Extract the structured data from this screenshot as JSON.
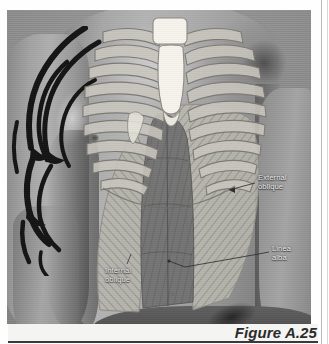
{
  "figure": {
    "caption": "Figure A.25",
    "alt_subject": "Male torso photograph with anatomical overlay of rib cage and abdominal musculature",
    "labels": [
      {
        "id": "external-oblique",
        "text": "External\noblique",
        "position": "right-upper"
      },
      {
        "id": "linea-alba",
        "text": "Linea\nalba",
        "position": "right-lower"
      },
      {
        "id": "internal-oblique",
        "text": "Internal\noblique",
        "position": "left-lower"
      }
    ],
    "anatomy_structures": [
      {
        "id": "sternum",
        "name": "Sternum",
        "fill": "#f3f1ea"
      },
      {
        "id": "ribs",
        "name": "Rib cage",
        "fill": "#c9c7bf"
      },
      {
        "id": "rectus-abdominis",
        "name": "Rectus abdominis",
        "fill": "#6e6e6e"
      },
      {
        "id": "external-oblique",
        "name": "External oblique",
        "fill": "#b5b3ab"
      },
      {
        "id": "internal-oblique",
        "name": "Internal oblique",
        "fill": "#b0aea6"
      },
      {
        "id": "tattoo",
        "name": "Tribal arm tattoo",
        "fill": "#1c1c1c"
      }
    ],
    "colors": {
      "page": "#fefefe",
      "photo_backdrop": "#8e8e8e",
      "skin_mid": "#a8a8a8",
      "overlay_light": "#c9c7bf",
      "overlay_dark": "#6e6e6e",
      "label_text": "#f2f2f2",
      "caption_text": "#2b2b2b",
      "rule": "#3a3a3a"
    }
  }
}
